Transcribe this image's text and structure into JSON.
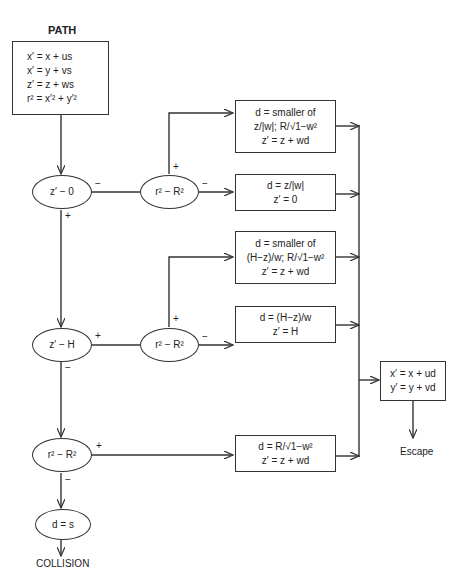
{
  "diagram": {
    "title_top": "PATH",
    "title_bottom": "COLLISION",
    "escape_label": "Escape",
    "path_box": {
      "lines": [
        "x′ = x + us",
        "x′ = y + vs",
        "z′ = z + ws",
        "r² = x′² + y′²"
      ]
    },
    "decisions": {
      "z_zero": "z′ − 0",
      "r_R_1": "r² − R²",
      "z_H": "z′ − H",
      "r_R_2": "r² − R²",
      "r_R_3": "r² − R²",
      "d_s": "d = s"
    },
    "result_boxes": {
      "box1": [
        "d = smaller of",
        "z/|w|; R/√1−w²",
        "z′ = z + wd"
      ],
      "box2": [
        "d = z/|w|",
        "z′ = 0"
      ],
      "box3": [
        "d = smaller of",
        "(H−z)/w; R/√1−w²",
        "z′ = z + wd"
      ],
      "box4": [
        "d = (H−z)/w",
        "z′ = H"
      ],
      "box5": [
        "d = R/√1−w²",
        "z′ = z + wd"
      ]
    },
    "escape_box": [
      "x′ = x + ud",
      "y′ = y + vd"
    ],
    "signs": {
      "plus": "+",
      "minus": "−"
    }
  }
}
